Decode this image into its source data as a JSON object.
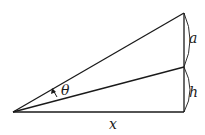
{
  "diagram": {
    "labels": {
      "a": "a",
      "h": "h",
      "x": "x",
      "theta": "θ"
    },
    "points": {
      "origin": [
        13,
        112
      ],
      "bottom_right": [
        184,
        112
      ],
      "middle_right": [
        184,
        67
      ],
      "top_right": [
        184,
        13
      ]
    },
    "colors": {
      "stroke": "#1a1a1a",
      "background": "#ffffff"
    }
  }
}
